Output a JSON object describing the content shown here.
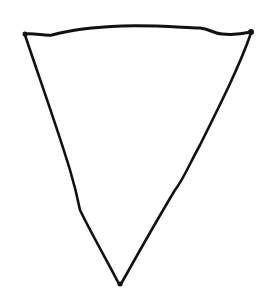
{
  "drawing": {
    "subject": "hand-drawn inverted triangle",
    "stroke_color": "#111111",
    "background_color": "#ffffff",
    "vertices": {
      "top_left": [
        25,
        34
      ],
      "top_right": [
        251,
        32
      ],
      "bottom": [
        120,
        284
      ]
    }
  }
}
